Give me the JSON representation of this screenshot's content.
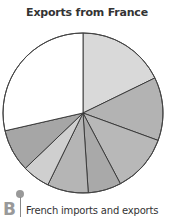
{
  "chart_data": {
    "type": "pie",
    "title": "Exports from France",
    "start_angle_deg": 0,
    "direction": "clockwise",
    "slices": [
      {
        "label": "",
        "value": 17.8,
        "color": "#d9d9d9"
      },
      {
        "label": "",
        "value": 12.8,
        "color": "#b3b3b3"
      },
      {
        "label": "",
        "value": 11.7,
        "color": "#b8b8b8"
      },
      {
        "label": "",
        "value": 6.7,
        "color": "#a9a9a9"
      },
      {
        "label": "",
        "value": 8.3,
        "color": "#b5b5b5"
      },
      {
        "label": "",
        "value": 5.6,
        "color": "#cfcfcf"
      },
      {
        "label": "",
        "value": 8.6,
        "color": "#a6a6a6"
      },
      {
        "label": "",
        "value": 28.6,
        "color": "#ffffff"
      }
    ],
    "legend": "none"
  },
  "caption": {
    "letter": "B",
    "text": "French imports and exports"
  }
}
